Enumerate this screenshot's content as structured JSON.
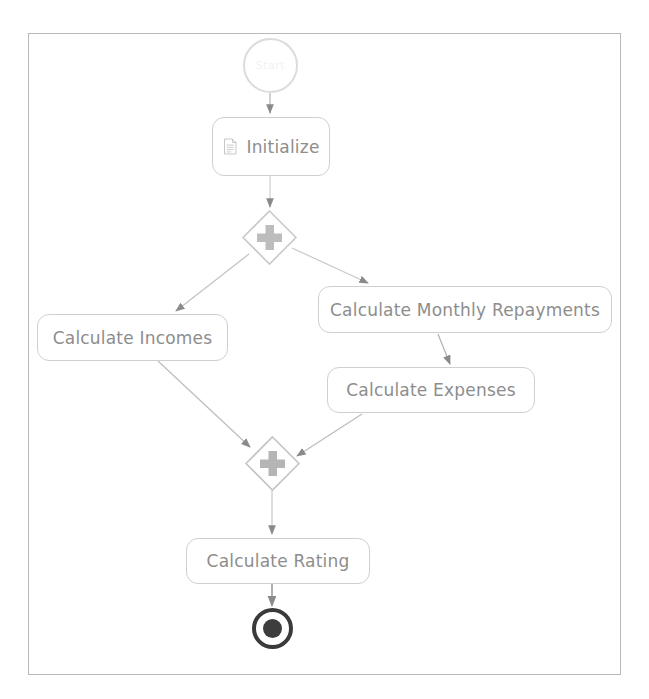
{
  "diagram": {
    "type": "bpmn-process-diagram",
    "background_color": "#ffffff",
    "frame_border_color": "#b9b9b9",
    "node_border_color": "#cfcfcf",
    "text_color": "#8d8d8d",
    "connector_color": "#aaaaaa",
    "end_event_color": "#3d3d3d",
    "nodes": [
      {
        "id": "start",
        "type": "start-event",
        "label": "Start",
        "icon": "start-event-circle"
      },
      {
        "id": "initialize",
        "type": "task",
        "label": "Initialize",
        "icon": "script-document-icon"
      },
      {
        "id": "fork",
        "type": "parallel-gateway",
        "label": "",
        "icon": "plus-icon"
      },
      {
        "id": "calculate-incomes",
        "type": "task",
        "label": "Calculate Incomes",
        "icon": ""
      },
      {
        "id": "calculate-monthly-repayments",
        "type": "task",
        "label": "Calculate Monthly Repayments",
        "icon": ""
      },
      {
        "id": "calculate-expenses",
        "type": "task",
        "label": "Calculate Expenses",
        "icon": ""
      },
      {
        "id": "join",
        "type": "parallel-gateway",
        "label": "",
        "icon": "plus-icon"
      },
      {
        "id": "calculate-rating",
        "type": "task",
        "label": "Calculate Rating",
        "icon": ""
      },
      {
        "id": "end",
        "type": "end-event",
        "label": "",
        "icon": "end-event-circle"
      }
    ],
    "flows": [
      {
        "from": "start",
        "to": "initialize"
      },
      {
        "from": "initialize",
        "to": "fork"
      },
      {
        "from": "fork",
        "to": "calculate-incomes"
      },
      {
        "from": "fork",
        "to": "calculate-monthly-repayments"
      },
      {
        "from": "calculate-monthly-repayments",
        "to": "calculate-expenses"
      },
      {
        "from": "calculate-incomes",
        "to": "join"
      },
      {
        "from": "calculate-expenses",
        "to": "join"
      },
      {
        "from": "join",
        "to": "calculate-rating"
      },
      {
        "from": "calculate-rating",
        "to": "end"
      }
    ]
  }
}
